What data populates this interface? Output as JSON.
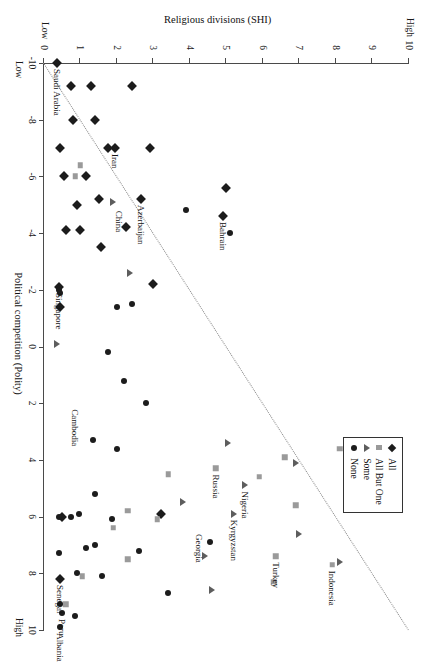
{
  "chart_data": {
    "type": "scatter",
    "title": "",
    "xlabel": "Political competition (Polity)",
    "ylabel": "Religious divisions (SHI)",
    "xlim": [
      -10,
      10
    ],
    "ylim": [
      0,
      10
    ],
    "x_ticks": [
      -10,
      -8,
      -6,
      -4,
      -2,
      0,
      2,
      4,
      6,
      8,
      10
    ],
    "y_ticks": [
      0,
      1,
      2,
      3,
      4,
      5,
      6,
      7,
      8,
      9,
      10
    ],
    "x_low_label": "Low",
    "x_high_label": "High",
    "y_low_label": "Low",
    "y_high_label": "High",
    "grid": false,
    "legend_position": "top-left",
    "annotation_line": {
      "style": "dotted",
      "from": [
        -10,
        0
      ],
      "to": [
        10,
        10
      ]
    },
    "series": [
      {
        "name": "All",
        "marker": "diamond",
        "color": "#1c1c1c",
        "points": [
          {
            "x": -10,
            "y": 0.35
          },
          {
            "x": -9.2,
            "y": 2.4
          },
          {
            "x": -9.2,
            "y": 1.3
          },
          {
            "x": -9.2,
            "y": 0.75
          },
          {
            "x": -8,
            "y": 1.4
          },
          {
            "x": -8,
            "y": 0.8
          },
          {
            "x": -7,
            "y": 2.9
          },
          {
            "x": -7,
            "y": 1.95
          },
          {
            "x": -7,
            "y": 1.75
          },
          {
            "x": -7,
            "y": 0.45
          },
          {
            "x": -6,
            "y": 1.15
          },
          {
            "x": -6,
            "y": 0.55
          },
          {
            "x": -5.6,
            "y": 5.0
          },
          {
            "x": -5.2,
            "y": 2.65
          },
          {
            "x": -5.2,
            "y": 1.5
          },
          {
            "x": -5.0,
            "y": 0.9
          },
          {
            "x": -4.6,
            "y": 4.9
          },
          {
            "x": -4.2,
            "y": 2.25
          },
          {
            "x": -4.1,
            "y": 1.0
          },
          {
            "x": -4.1,
            "y": 0.6
          },
          {
            "x": -3.5,
            "y": 1.55
          },
          {
            "x": -2.2,
            "y": 3.0
          },
          {
            "x": -2.1,
            "y": 0.4
          },
          {
            "x": -1.4,
            "y": 0.45
          },
          {
            "x": 5.9,
            "y": 3.2
          },
          {
            "x": 6.0,
            "y": 0.5
          },
          {
            "x": 8.2,
            "y": 0.45
          }
        ]
      },
      {
        "name": "All But One",
        "marker": "square",
        "color": "#9a9a9a",
        "points": [
          {
            "x": -6.4,
            "y": 1.0
          },
          {
            "x": -6.0,
            "y": 0.85
          },
          {
            "x": 3.6,
            "y": 8.1
          },
          {
            "x": 3.9,
            "y": 6.6
          },
          {
            "x": 4.3,
            "y": 4.7
          },
          {
            "x": 4.5,
            "y": 3.4
          },
          {
            "x": 4.6,
            "y": 5.9
          },
          {
            "x": 5.6,
            "y": 6.9
          },
          {
            "x": 5.8,
            "y": 2.3
          },
          {
            "x": 6.1,
            "y": 3.1
          },
          {
            "x": 6.4,
            "y": 1.9
          },
          {
            "x": 7.4,
            "y": 6.35
          },
          {
            "x": 7.5,
            "y": 2.3
          },
          {
            "x": 7.7,
            "y": 7.9
          },
          {
            "x": 8.1,
            "y": 1.05
          },
          {
            "x": 8.3,
            "y": 6.3
          },
          {
            "x": 9.1,
            "y": 0.6
          }
        ]
      },
      {
        "name": "Some",
        "marker": "triangle",
        "color": "#5d5d5d",
        "points": [
          {
            "x": -5.1,
            "y": 1.9
          },
          {
            "x": -2.6,
            "y": 2.35
          },
          {
            "x": -0.1,
            "y": 0.35
          },
          {
            "x": 3.4,
            "y": 5.05
          },
          {
            "x": 4.1,
            "y": 6.9
          },
          {
            "x": 4.9,
            "y": 5.5
          },
          {
            "x": 5.5,
            "y": 3.8
          },
          {
            "x": 5.9,
            "y": 5.2
          },
          {
            "x": 6.6,
            "y": 7.0
          },
          {
            "x": 7.4,
            "y": 4.4
          },
          {
            "x": 7.6,
            "y": 8.1
          },
          {
            "x": 8.6,
            "y": 4.6
          }
        ]
      },
      {
        "name": "None",
        "marker": "circle",
        "color": "#1c1c1c",
        "points": [
          {
            "x": -4.8,
            "y": 3.9
          },
          {
            "x": -4.0,
            "y": 5.1
          },
          {
            "x": -2.0,
            "y": 0.4
          },
          {
            "x": -1.9,
            "y": 0.45
          },
          {
            "x": -1.5,
            "y": 2.4
          },
          {
            "x": -1.4,
            "y": 2.0
          },
          {
            "x": 0.2,
            "y": 1.75
          },
          {
            "x": 1.2,
            "y": 2.2
          },
          {
            "x": 2.0,
            "y": 2.8
          },
          {
            "x": 3.3,
            "y": 1.35
          },
          {
            "x": 3.6,
            "y": 2.0
          },
          {
            "x": 5.2,
            "y": 1.4
          },
          {
            "x": 5.9,
            "y": 0.95
          },
          {
            "x": 6.0,
            "y": 0.75
          },
          {
            "x": 6.0,
            "y": 0.4
          },
          {
            "x": 6.1,
            "y": 1.85
          },
          {
            "x": 6.9,
            "y": 4.55
          },
          {
            "x": 7.0,
            "y": 1.4
          },
          {
            "x": 7.1,
            "y": 1.15
          },
          {
            "x": 7.2,
            "y": 2.6
          },
          {
            "x": 7.3,
            "y": 0.4
          },
          {
            "x": 8.0,
            "y": 0.9
          },
          {
            "x": 8.1,
            "y": 1.6
          },
          {
            "x": 8.7,
            "y": 3.4
          },
          {
            "x": 9.1,
            "y": 0.45
          },
          {
            "x": 9.4,
            "y": 0.5
          },
          {
            "x": 9.5,
            "y": 0.85
          },
          {
            "x": 9.9,
            "y": 0.45
          }
        ]
      }
    ],
    "point_labels": [
      {
        "text": "Saudi Arabia",
        "x": -10,
        "y": 0.35,
        "marker": "all",
        "anchor": "right"
      },
      {
        "text": "Iran",
        "x": -7,
        "y": 1.95,
        "marker": "none",
        "anchor": "right"
      },
      {
        "text": "Azerbaijan",
        "x": -5.2,
        "y": 2.65,
        "marker": "all",
        "anchor": "right"
      },
      {
        "text": "China",
        "x": -5.0,
        "y": 2.05,
        "marker": "all",
        "anchor": "right"
      },
      {
        "text": "Bahrain",
        "x": -4.6,
        "y": 4.9,
        "marker": "some",
        "anchor": "right"
      },
      {
        "text": "Singapore",
        "x": -2.1,
        "y": 0.4,
        "marker": "none",
        "anchor": "right"
      },
      {
        "text": "Cambodia",
        "x": 2.0,
        "y": 0.85,
        "marker": "none",
        "anchor": "right"
      },
      {
        "text": "Russia",
        "x": 4.3,
        "y": 4.7,
        "marker": "allbutone",
        "anchor": "right"
      },
      {
        "text": "Nigeria",
        "x": 4.9,
        "y": 5.5,
        "marker": "some",
        "anchor": "right"
      },
      {
        "text": "Kyrgyzstan",
        "x": 5.9,
        "y": 5.2,
        "marker": "some",
        "anchor": "right"
      },
      {
        "text": "Georgia",
        "x": 6.4,
        "y": 4.25,
        "marker": "allbutone",
        "anchor": "right"
      },
      {
        "text": "Turkey",
        "x": 7.4,
        "y": 6.35,
        "marker": "allbutone",
        "anchor": "right"
      },
      {
        "text": "Indonesia",
        "x": 7.7,
        "y": 7.9,
        "marker": "allbutone",
        "anchor": "right"
      },
      {
        "text": "Senegal",
        "x": 8.2,
        "y": 0.45,
        "marker": "all",
        "anchor": "right"
      },
      {
        "text": "Peru",
        "x": 9.4,
        "y": 0.5,
        "marker": "none",
        "anchor": "right"
      },
      {
        "text": "Albania",
        "x": 9.9,
        "y": 0.45,
        "marker": "none",
        "anchor": "right"
      }
    ]
  },
  "legend": {
    "items": [
      {
        "label": "All",
        "marker": "m-all"
      },
      {
        "label": "All But One",
        "marker": "m-abo"
      },
      {
        "label": "Some",
        "marker": "m-some"
      },
      {
        "label": "None",
        "marker": "m-none"
      }
    ]
  }
}
